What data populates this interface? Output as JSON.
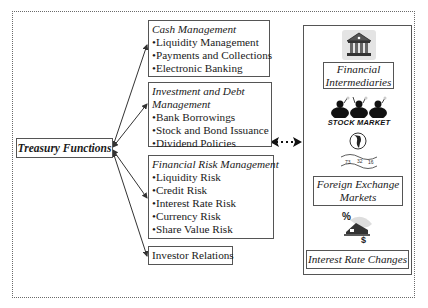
{
  "diagram": {
    "root": {
      "label": "Treasury Functions"
    },
    "functions": [
      {
        "title": "Cash Management",
        "items": [
          "•Liquidity Management",
          "•Payments and Collections",
          "•Electronic Banking"
        ]
      },
      {
        "title_lines": [
          "Investment and Debt",
          "Management"
        ],
        "items": [
          "•Bank Borrowings",
          "•Stock and Bond Issuance",
          "•Dividend Policies"
        ]
      },
      {
        "title": "Financial Risk Management",
        "items": [
          "•Liquidity Risk",
          "•Credit Risk",
          "•Interest Rate Risk",
          "•Currency Risk",
          "•Share Value Risk"
        ]
      },
      {
        "title": "Investor Relations",
        "items": []
      }
    ],
    "environment": {
      "financial_intermediaries": [
        "Financial",
        "Intermediaries"
      ],
      "stock_market_label": "STOCK MARKET",
      "fx_values": [
        "73",
        "32",
        "16"
      ],
      "foreign_exchange": [
        "Foreign Exchange",
        "Markets"
      ],
      "interest_rate_changes": "Interest Rate Changes",
      "interest_symbols": {
        "percent": "%",
        "dollar": "$"
      }
    },
    "connector": "bidirectional dotted arrow"
  },
  "colors": {
    "border": "#555555",
    "outer_dotted": "#6a6a6a",
    "text": "#1a1a1a"
  }
}
